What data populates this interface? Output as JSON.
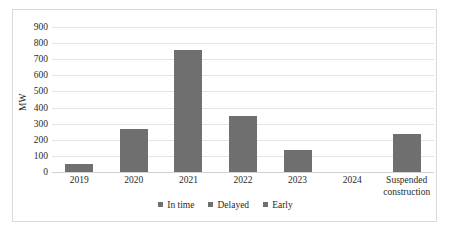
{
  "chart_data": {
    "type": "bar",
    "title": "",
    "subtitle": "",
    "xlabel": "",
    "ylabel": "MW",
    "ylim": [
      0,
      900
    ],
    "ytick_step": 100,
    "yticks": [
      "900",
      "800",
      "700",
      "600",
      "500",
      "400",
      "300",
      "200",
      "100",
      "0"
    ],
    "ytick_values": [
      900,
      800,
      700,
      600,
      500,
      400,
      300,
      200,
      100,
      0
    ],
    "grid": true,
    "grid_axis": "y",
    "categories": [
      "2019",
      "2020",
      "2021",
      "2022",
      "2023",
      "2024",
      "Suspended construction"
    ],
    "category_lines": [
      [
        "2019"
      ],
      [
        "2020"
      ],
      [
        "2021"
      ],
      [
        "2022"
      ],
      [
        "2023"
      ],
      [
        "2024"
      ],
      [
        "Suspended",
        "construction"
      ]
    ],
    "values": [
      50,
      270,
      760,
      350,
      135,
      0,
      235
    ],
    "series": [
      {
        "name": "In time",
        "values": [
          50,
          270,
          760,
          350,
          135,
          0,
          235
        ]
      }
    ],
    "legend": [
      "In time",
      "Delayed",
      "Early"
    ],
    "legend_position": "bottom",
    "bar_color": "#6f6f6f",
    "grid_color": "#e4e4e4",
    "text_color": "#2a2a2a",
    "border_color": "#d9d9d9",
    "background": "#ffffff"
  },
  "legend": {
    "items": [
      {
        "label": "In time",
        "color": "#6f6f6f"
      },
      {
        "label": "Delayed",
        "color": "#6f6f6f"
      },
      {
        "label": "Early",
        "color": "#6f6f6f"
      }
    ]
  }
}
